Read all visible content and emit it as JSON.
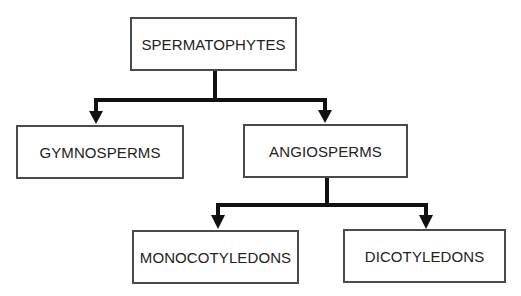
{
  "diagram": {
    "type": "hierarchy-tree",
    "nodes": {
      "root": {
        "label": "SPERMATOPHYTES"
      },
      "gymnosperms": {
        "label": "GYMNOSPERMS"
      },
      "angiosperms": {
        "label": "ANGIOSPERMS"
      },
      "monocotyledons": {
        "label": "MONOCOTYLEDONS"
      },
      "dicotyledons": {
        "label": "DICOTYLEDONS"
      }
    },
    "edges": [
      {
        "from": "SPERMATOPHYTES",
        "to": "GYMNOSPERMS"
      },
      {
        "from": "SPERMATOPHYTES",
        "to": "ANGIOSPERMS"
      },
      {
        "from": "ANGIOSPERMS",
        "to": "MONOCOTYLEDONS"
      },
      {
        "from": "ANGIOSPERMS",
        "to": "DICOTYLEDONS"
      }
    ],
    "colors": {
      "line": "#111111",
      "box_border": "#4a4a4a",
      "text": "#222222",
      "background": "#ffffff"
    }
  }
}
